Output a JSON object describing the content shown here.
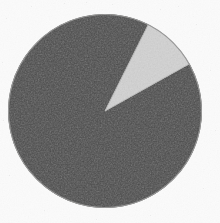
{
  "chart_data": {
    "type": "pie",
    "title": "",
    "subtitle": "",
    "xlabel": "",
    "ylabel": "",
    "grid": false,
    "legend": "none",
    "labels_shown": false,
    "categories": [
      "Major share",
      "Minor share"
    ],
    "values": [
      90.5,
      9.5
    ],
    "angles_deg": [
      325.8,
      34.2
    ],
    "colors": [
      "#4a4a4a",
      "#d4d4d4"
    ],
    "start_angle_deg": -63.4,
    "direction": "counterclockwise",
    "slices": [
      {
        "label": "Major share",
        "value": 90.5,
        "angle_deg": 325.8,
        "color": "#4a4a4a",
        "start_deg": -28.9,
        "end_deg": -63.4
      },
      {
        "label": "Minor share",
        "value": 9.5,
        "angle_deg": 34.2,
        "color": "#d4d4d4",
        "start_deg": -63.4,
        "end_deg": -28.9
      }
    ],
    "annotations": []
  },
  "figure": {
    "background_color": "#fbfbfb",
    "outline_color": "#9a9a9a",
    "width": 220,
    "height": 223,
    "center_x": 105,
    "center_y": 111,
    "radius": 96.5
  }
}
